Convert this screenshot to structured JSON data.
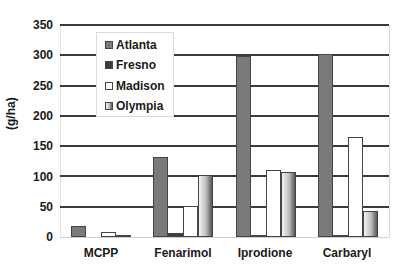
{
  "chart_data": {
    "type": "bar",
    "title": "",
    "xlabel": "",
    "ylabel": "(g/ha)",
    "ylim": [
      0,
      350
    ],
    "yticks": [
      0,
      50,
      100,
      150,
      200,
      250,
      300,
      350
    ],
    "grid": true,
    "legend_position": "upper-left inside",
    "categories": [
      "MCPP",
      "Fenarimol",
      "Iprodione",
      "Carbaryl"
    ],
    "series": [
      {
        "name": "Atlanta",
        "values": [
          19,
          132,
          299,
          302
        ]
      },
      {
        "name": "Fresno",
        "values": [
          0,
          6,
          2,
          3
        ]
      },
      {
        "name": "Madison",
        "values": [
          8,
          51,
          110,
          165
        ]
      },
      {
        "name": "Olympia",
        "values": [
          2,
          102,
          108,
          43
        ]
      }
    ]
  },
  "labels": {
    "ylabel": "(g/ha)",
    "yticks": [
      "0",
      "50",
      "100",
      "150",
      "200",
      "250",
      "300",
      "350"
    ],
    "categories": [
      "MCPP",
      "Fenarimol",
      "Iprodione",
      "Carbaryl"
    ],
    "legend": [
      "Atlanta",
      "Fresno",
      "Madison",
      "Olympia"
    ]
  },
  "colors": {
    "Atlanta": "#7a7a7a",
    "Fresno": "#3c3c3c",
    "Madison": "#ffffff",
    "Olympia": "gradient-gray"
  }
}
